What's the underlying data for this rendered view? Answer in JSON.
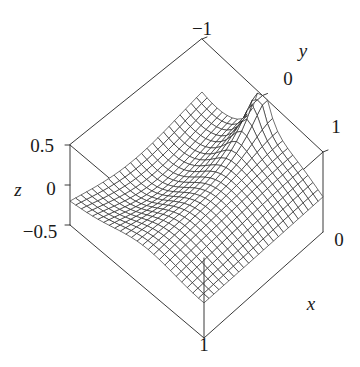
{
  "figure": {
    "kind": "3d-surface-wireframe",
    "background": "#ffffff",
    "line_color": "#1a1a1a",
    "box_color": "#3a3a3a"
  },
  "chart_data": {
    "type": "line",
    "subtype": "surface3d-wireframe",
    "title": "",
    "xlabel": "x",
    "ylabel": "y",
    "zlabel": "z",
    "xlim": [
      0,
      1
    ],
    "ylim": [
      -1,
      1
    ],
    "zlim": [
      -0.5,
      0.5
    ],
    "xticks": [
      0,
      1
    ],
    "xticklabels": [
      "0",
      "1"
    ],
    "yticks": [
      -1,
      0,
      1
    ],
    "yticklabels": [
      "−1",
      "0",
      "1"
    ],
    "zticks": [
      -0.5,
      0,
      0.5
    ],
    "zticklabels": [
      "−0.5",
      "0",
      "0.5"
    ],
    "grid": false,
    "legend": null,
    "mesh": {
      "u_lines": 25,
      "v_lines": 25
    },
    "surface_description": "Saddle-like surface with a sharp cusp rising to the z-maximum at the (x=0, y=0) corner and a smooth ridge falling toward the far corner; values span the full z range -0.5 to 0.5.",
    "annotations": []
  },
  "labels": {
    "y_axis": "y",
    "x_axis": "x",
    "z_axis": "z",
    "tick_y_neg1": "−1",
    "tick_y_0": "0",
    "tick_y_1": "1",
    "tick_x_0": "0",
    "tick_x_1": "1",
    "tick_z_pos": "0.5",
    "tick_z_zero": "0",
    "tick_z_neg": "−0.5"
  }
}
